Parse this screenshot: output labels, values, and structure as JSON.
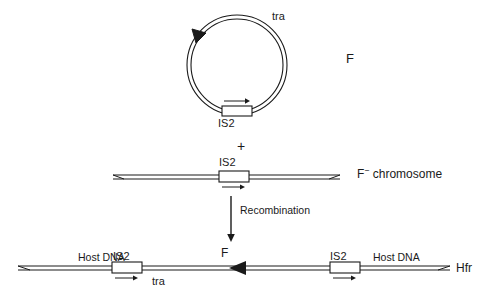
{
  "figure": {
    "stroke_color": "#1a1a1a",
    "background_color": "#ffffff",
    "width": 487,
    "height": 296
  },
  "plasmid": {
    "name": "F plasmid circle",
    "label_f": "F",
    "label_tra": "tra",
    "label_is2": "IS2",
    "direction_arrow": "counterclockwise-arrowhead-upper-left",
    "is2_arrow_direction": "right",
    "center_x": 237,
    "center_y": 65,
    "radius": 48
  },
  "operator": {
    "plus": "+"
  },
  "f_minus_chromosome": {
    "name": "F-minus chromosome",
    "label_prefix": "F",
    "label_superscript": "−",
    "label_suffix": "chromosome",
    "label_full": "F− chromosome",
    "label_is2": "IS2",
    "is2_arrow_direction": "right",
    "line_left_x": 113,
    "line_right_x": 340,
    "line_y": 177
  },
  "recombination": {
    "label": "Recombination",
    "arrow_direction": "down",
    "arrow_x": 231,
    "arrow_top_y": 192,
    "arrow_bottom_y": 238
  },
  "hfr_chromosome": {
    "name": "Hfr chromosome",
    "label": "Hfr",
    "label_f_integrated": "F",
    "label_tra": "tra",
    "host_dna_left": "Host DNA",
    "host_dna_right": "Host DNA",
    "is2_left": "IS2",
    "is2_right": "IS2",
    "is2_left_arrow_direction": "right",
    "is2_right_arrow_direction": "right",
    "transfer_arrowhead_direction": "left",
    "line_left_x": 18,
    "line_right_x": 450,
    "line_y": 268
  }
}
